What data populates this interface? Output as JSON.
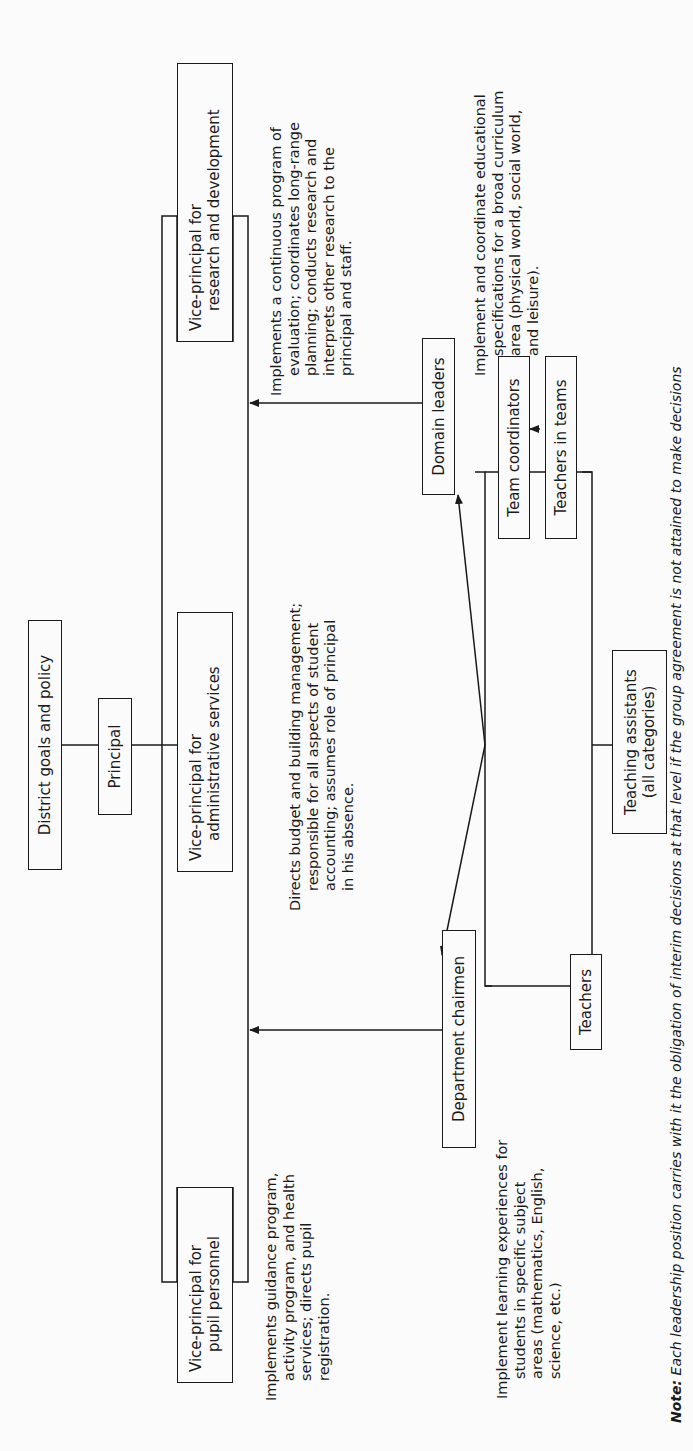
{
  "diagram": {
    "type": "organizational-chart",
    "orientation": "rotated-90-ccw",
    "nodes": {
      "district": {
        "label": "District goals and policy"
      },
      "principal": {
        "label": "Principal"
      },
      "vp_research": {
        "line1": "Vice-principal for",
        "line2": "research and development"
      },
      "vp_admin": {
        "line1": "Vice-principal for",
        "line2": "administrative services"
      },
      "vp_pupil": {
        "line1": "Vice-principal for",
        "line2": "pupil personnel"
      },
      "domain_leaders": {
        "label": "Domain leaders"
      },
      "department_chairmen": {
        "label": "Department chairmen"
      },
      "team_coordinators": {
        "label": "Team coordinators"
      },
      "teachers_in_teams": {
        "label": "Teachers in teams"
      },
      "teachers": {
        "label": "Teachers"
      },
      "teaching_assistants": {
        "line1": "Teaching assistants",
        "line2": "(all categories)"
      }
    },
    "descriptions": {
      "vp_research": [
        "Implements a continuous program of",
        "evaluation; coordinates long-range",
        "planning; conducts research and",
        "interprets other research to the",
        "principal and staff."
      ],
      "vp_admin": [
        "Directs budget and building management;",
        "responsible for all aspects of student",
        "accounting; assumes role of principal",
        "in his absence."
      ],
      "vp_pupil": [
        "Implements guidance program,",
        "activity program, and health",
        "services; directs pupil",
        "registration."
      ],
      "domain_leaders": [
        "Implement and coordinate educational",
        "specifications for a broad curriculum",
        "area (physical world, social world,",
        "and leisure)."
      ],
      "department_chairmen": [
        "Implement learning experiences for",
        "students in specific subject",
        "areas (mathematics, English,",
        "science, etc.)"
      ]
    },
    "edges": [
      {
        "from": "district",
        "to": "principal",
        "type": "line"
      },
      {
        "from": "principal",
        "to": "vice-principal-rail",
        "type": "line"
      },
      {
        "from": "domain_leaders",
        "to": "vice-principal-rail",
        "type": "arrow"
      },
      {
        "from": "department_chairmen",
        "to": "vice-principal-rail",
        "type": "arrow"
      },
      {
        "from": "teachers-hub",
        "to": "domain_leaders",
        "type": "arrow"
      },
      {
        "from": "teachers-hub",
        "to": "department_chairmen",
        "type": "arrow"
      },
      {
        "from": "teachers_in_teams",
        "to": "team_coordinators",
        "type": "arrow"
      }
    ],
    "note": {
      "prefix": "Note:",
      "text": "Each leadership position carries with it the obligation of interim decisions at that level if the group agreement is not attained to make decisions"
    }
  }
}
